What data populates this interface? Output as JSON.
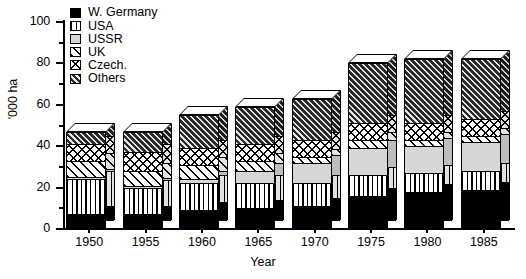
{
  "chart_data": {
    "type": "bar",
    "subtype": "stacked-bar-3d",
    "title": "",
    "xlabel": "Year",
    "ylabel": "'000 ha",
    "categories": [
      "1950",
      "1955",
      "1960",
      "1965",
      "1970",
      "1975",
      "1980",
      "1985"
    ],
    "ylim": [
      0,
      100
    ],
    "yticks_major": [
      "0",
      "20",
      "40",
      "60",
      "80",
      "100"
    ],
    "yticks_minor": [
      10,
      30,
      50,
      70,
      90
    ],
    "grid": false,
    "legend_position": "top-left",
    "series": [
      {
        "name": "W. Germany",
        "pattern": "solid-black",
        "color": "#000000",
        "values": [
          7,
          7,
          9,
          10,
          11,
          16,
          18,
          19
        ]
      },
      {
        "name": "USA",
        "pattern": "vertical-lines",
        "color": "#ffffff",
        "values": [
          17,
          13,
          13,
          12,
          11,
          10,
          9,
          9
        ]
      },
      {
        "name": "USSR",
        "pattern": "light-gray-solid",
        "color": "#d6d6d6",
        "values": [
          1,
          1,
          2,
          6,
          10,
          13,
          13,
          14
        ]
      },
      {
        "name": "UK",
        "pattern": "diagonal-stripes",
        "color": "#ffffff",
        "values": [
          8,
          7,
          7,
          5,
          3,
          4,
          3,
          3
        ]
      },
      {
        "name": "Czech.",
        "pattern": "crosshatch",
        "color": "#ffffff",
        "values": [
          8,
          9,
          8,
          8,
          8,
          8,
          8,
          8
        ]
      },
      {
        "name": "Others",
        "pattern": "dense-dark-hatch",
        "color": "#2a2a2a",
        "values": [
          6,
          10,
          16,
          18,
          20,
          29,
          31,
          29
        ]
      }
    ],
    "totals": [
      47,
      47,
      55,
      59,
      63,
      80,
      82,
      82
    ]
  },
  "legend": {
    "items": [
      {
        "label": "W. Germany"
      },
      {
        "label": "USA"
      },
      {
        "label": "USSR"
      },
      {
        "label": "UK"
      },
      {
        "label": "Czech."
      },
      {
        "label": "Others"
      }
    ]
  },
  "axes": {
    "y_title": "'000 ha",
    "x_title": "Year"
  }
}
